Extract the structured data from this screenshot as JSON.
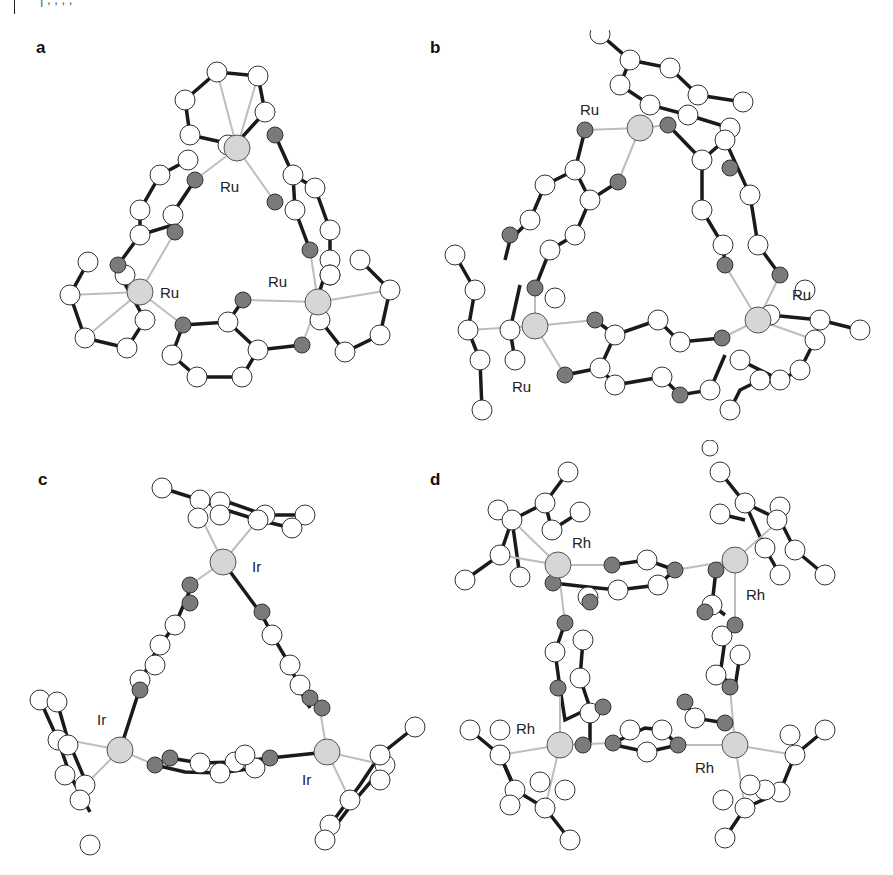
{
  "header": {
    "clipped_text": "| , , , ,"
  },
  "figure": {
    "panels": [
      {
        "label": "a",
        "metal": "Ru",
        "metal_labels": [
          "Ru",
          "Ru",
          "Ru"
        ],
        "shape": "triangle"
      },
      {
        "label": "b",
        "metal": "Ru",
        "metal_labels": [
          "Ru",
          "Ru",
          "Ru"
        ],
        "shape": "triangle"
      },
      {
        "label": "c",
        "metal": "Ir",
        "metal_labels": [
          "Ir",
          "Ir",
          "Ir"
        ],
        "shape": "triangle"
      },
      {
        "label": "d",
        "metal": "Rh",
        "metal_labels": [
          "Rh",
          "Rh",
          "Rh",
          "Rh"
        ],
        "shape": "square"
      }
    ],
    "colors": {
      "carbon": "#ffffff",
      "heteroatom": "#7a7a7a",
      "metal": "#d6d6d6",
      "bond": "#1a1a1a",
      "coord_bond": "#bdbdbd"
    }
  }
}
